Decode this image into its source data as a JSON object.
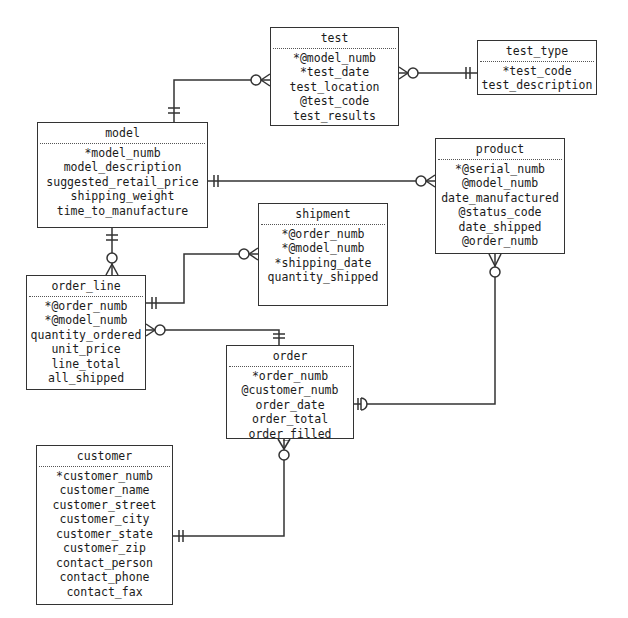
{
  "diagram": {
    "type": "entity-relationship",
    "entities": [
      {
        "id": "test",
        "name": "test",
        "attributes": [
          "*@model_numb",
          "*test_date",
          "test_location",
          "@test_code",
          "test_results"
        ]
      },
      {
        "id": "test_type",
        "name": "test_type",
        "attributes": [
          "*test_code",
          "test_description"
        ]
      },
      {
        "id": "model",
        "name": "model",
        "attributes": [
          "*model_numb",
          "model_description",
          "suggested_retail_price",
          "shipping_weight",
          "time_to_manufacture"
        ]
      },
      {
        "id": "product",
        "name": "product",
        "attributes": [
          "*@serial_numb",
          "@model_numb",
          "date_manufactured",
          "@status_code",
          "date_shipped",
          "@order_numb"
        ]
      },
      {
        "id": "shipment",
        "name": "shipment",
        "attributes": [
          "*@order_numb",
          "*@model_numb",
          "*shipping_date",
          "quantity_shipped"
        ]
      },
      {
        "id": "order_line",
        "name": "order_line",
        "attributes": [
          "*@order_numb",
          "*@model_numb",
          "quantity_ordered",
          "unit_price",
          "line_total",
          "all_shipped"
        ]
      },
      {
        "id": "order",
        "name": "order",
        "attributes": [
          "*order_numb",
          "@customer_numb",
          "order_date",
          "order_total",
          "order_filled"
        ]
      },
      {
        "id": "customer",
        "name": "customer",
        "attributes": [
          "*customer_numb",
          "customer_name",
          "customer_street",
          "customer_city",
          "customer_state",
          "customer_zip",
          "contact_person",
          "contact_phone",
          "contact_fax"
        ]
      }
    ],
    "relationships": [
      {
        "from": "model",
        "from_card": "one-and-only-one",
        "to": "test",
        "to_card": "zero-or-many"
      },
      {
        "from": "test_type",
        "from_card": "one-and-only-one",
        "to": "test",
        "to_card": "zero-or-many"
      },
      {
        "from": "model",
        "from_card": "one-and-only-one",
        "to": "product",
        "to_card": "zero-or-many"
      },
      {
        "from": "model",
        "from_card": "one-and-only-one",
        "to": "order_line",
        "to_card": "zero-or-many"
      },
      {
        "from": "order_line",
        "from_card": "one-and-only-one",
        "to": "shipment",
        "to_card": "zero-or-many"
      },
      {
        "from": "order",
        "from_card": "one-and-only-one",
        "to": "order_line",
        "to_card": "zero-or-many"
      },
      {
        "from": "order",
        "from_card": "zero-or-one",
        "to": "product",
        "to_card": "zero-or-many"
      },
      {
        "from": "customer",
        "from_card": "one-and-only-one",
        "to": "order",
        "to_card": "zero-or-many"
      }
    ],
    "colors": {
      "line": "#333333",
      "background": "#ffffff",
      "text": "#1a1a1a"
    }
  }
}
